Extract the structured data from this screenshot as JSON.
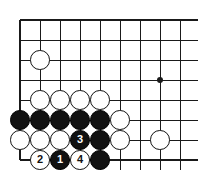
{
  "figure": {
    "kind": "go-board-diagram",
    "background_color": "#ffffff",
    "line_color": "#1a1a1a",
    "black_stone_color": "#111111",
    "white_stone_color": "#ffffff",
    "stone_outline_color": "#111111"
  },
  "board": {
    "origin_x": 20,
    "origin_y": 20,
    "spacing": 20,
    "columns": 9,
    "rows": 8,
    "edge_left": true,
    "edge_top": true,
    "edge_bottom": true,
    "edge_right": false,
    "edge_line_width": 2,
    "inner_line_width": 1,
    "star_points": [
      {
        "name": "hoshi",
        "col": 8,
        "row": 4,
        "radius": 3
      }
    ]
  },
  "stones": [
    {
      "id": "w-c2r3",
      "color": "white",
      "col": 2,
      "row": 3,
      "label": ""
    },
    {
      "id": "w-c2r5",
      "color": "white",
      "col": 2,
      "row": 5,
      "label": ""
    },
    {
      "id": "w-c3r5",
      "color": "white",
      "col": 3,
      "row": 5,
      "label": ""
    },
    {
      "id": "w-c4r5",
      "color": "white",
      "col": 4,
      "row": 5,
      "label": ""
    },
    {
      "id": "w-c5r5",
      "color": "white",
      "col": 5,
      "row": 5,
      "label": ""
    },
    {
      "id": "b-c1r6",
      "color": "black",
      "col": 1,
      "row": 6,
      "label": ""
    },
    {
      "id": "b-c2r6",
      "color": "black",
      "col": 2,
      "row": 6,
      "label": ""
    },
    {
      "id": "b-c3r6",
      "color": "black",
      "col": 3,
      "row": 6,
      "label": ""
    },
    {
      "id": "b-c4r6",
      "color": "black",
      "col": 4,
      "row": 6,
      "label": ""
    },
    {
      "id": "b-c5r6",
      "color": "black",
      "col": 5,
      "row": 6,
      "label": ""
    },
    {
      "id": "w-c6r6",
      "color": "white",
      "col": 6,
      "row": 6,
      "label": ""
    },
    {
      "id": "w-c1r7",
      "color": "white",
      "col": 1,
      "row": 7,
      "label": ""
    },
    {
      "id": "w-c2r7",
      "color": "white",
      "col": 2,
      "row": 7,
      "label": ""
    },
    {
      "id": "w-c3r7",
      "color": "white",
      "col": 3,
      "row": 7,
      "label": ""
    },
    {
      "id": "b-c4r7",
      "color": "black",
      "col": 4,
      "row": 7,
      "label": "3"
    },
    {
      "id": "b-c5r7",
      "color": "black",
      "col": 5,
      "row": 7,
      "label": ""
    },
    {
      "id": "w-c6r7",
      "color": "white",
      "col": 6,
      "row": 7,
      "label": ""
    },
    {
      "id": "w-c8r7",
      "color": "white",
      "col": 8,
      "row": 7,
      "label": ""
    },
    {
      "id": "w-c2r8",
      "color": "white",
      "col": 2,
      "row": 8,
      "label": "2"
    },
    {
      "id": "b-c3r8",
      "color": "black",
      "col": 3,
      "row": 8,
      "label": "1"
    },
    {
      "id": "w-c4r8",
      "color": "white",
      "col": 4,
      "row": 8,
      "label": "4"
    },
    {
      "id": "b-c5r8",
      "color": "black",
      "col": 5,
      "row": 8,
      "label": ""
    }
  ],
  "move_sequence": [
    {
      "number": "1",
      "color": "black",
      "col": 3,
      "row": 8
    },
    {
      "number": "2",
      "color": "white",
      "col": 2,
      "row": 8
    },
    {
      "number": "3",
      "color": "black",
      "col": 4,
      "row": 7
    },
    {
      "number": "4",
      "color": "white",
      "col": 4,
      "row": 8
    }
  ]
}
